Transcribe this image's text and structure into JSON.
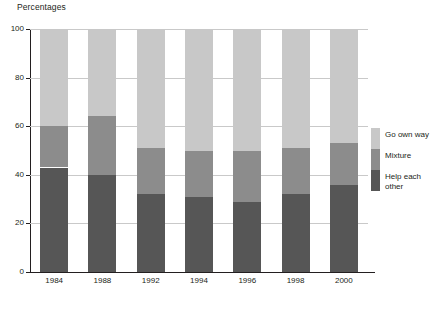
{
  "chart_data": {
    "type": "bar",
    "subtype": "stacked-bar-100",
    "title": "Percentages",
    "xlabel": "",
    "ylabel": "",
    "ylim": [
      0,
      100
    ],
    "yticks": [
      0,
      20,
      40,
      60,
      80,
      100
    ],
    "ytick_labels": [
      "0",
      "20",
      "40",
      "60",
      "80",
      "100"
    ],
    "grid": true,
    "legend_position": "right",
    "categories": [
      "1984",
      "1988",
      "1992",
      "1994",
      "1996",
      "1998",
      "2000"
    ],
    "series": [
      {
        "name": "Help each other",
        "color": "#565656",
        "values": [
          43,
          40,
          32,
          31,
          29,
          32,
          36
        ]
      },
      {
        "name": "Mixture",
        "color": "#8c8c8c",
        "values": [
          17,
          24,
          19,
          19,
          21,
          19,
          17
        ]
      },
      {
        "name": "Go own way",
        "color": "#c8c8c8",
        "values": [
          40,
          36,
          49,
          50,
          50,
          49,
          47
        ]
      }
    ],
    "stack_tops": {
      "help_each_other": [
        43,
        40,
        32,
        31,
        29,
        32,
        36
      ],
      "mixture_cumulative": [
        60,
        64,
        51,
        50,
        50,
        51,
        53
      ],
      "go_own_way_cumulative": [
        100,
        100,
        100,
        100,
        100,
        100,
        100
      ]
    }
  },
  "legend": {
    "items": [
      {
        "label": "Go own way",
        "color": "#c8c8c8"
      },
      {
        "label": "Mixture",
        "color": "#8c8c8c"
      },
      {
        "label": "Help each\nother",
        "color": "#565656"
      }
    ]
  },
  "colors": {
    "axis": "#231f20",
    "grid": "#c9c9c9",
    "background": "#ffffff"
  }
}
